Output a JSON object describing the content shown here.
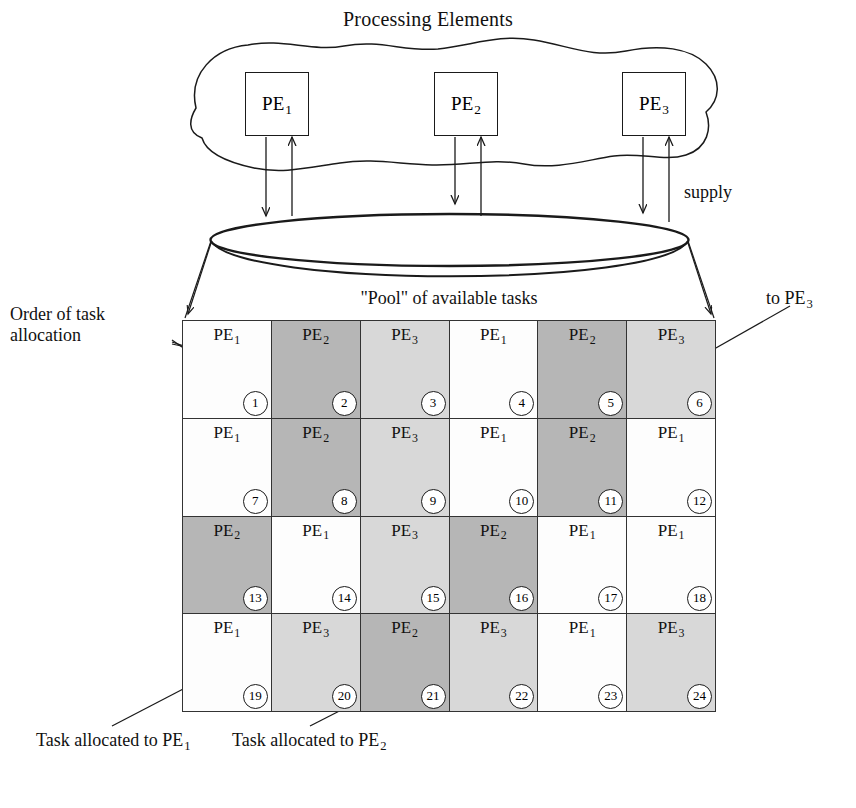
{
  "figure": {
    "title": "Processing Elements",
    "pool_caption": "\"Pool\" of available tasks",
    "supply_label": "supply",
    "to_pe3_label": "to PE",
    "to_pe3_sub": "3",
    "order_label": "Order of task allocation",
    "legend": [
      {
        "text": "Task allocated to PE",
        "sub": "1",
        "swatch": "#fdfdfd"
      },
      {
        "text": "Task allocated to PE",
        "sub": "2",
        "swatch": "#b6b6b6"
      }
    ]
  },
  "processing_elements": [
    {
      "name": "PE",
      "sub": "1"
    },
    {
      "name": "PE",
      "sub": "2"
    },
    {
      "name": "PE",
      "sub": "3"
    }
  ],
  "colors": {
    "pe1": "#fdfdfd",
    "pe2": "#b6b6b6",
    "pe3": "#d8d8d8",
    "stroke": "#1a1a1a",
    "grid_stroke": "#333333",
    "background": "#ffffff"
  },
  "grid": {
    "columns": 6,
    "rows": 4,
    "cells": [
      {
        "index": 1,
        "pe": "PE",
        "sub": "1",
        "cls": "pe1"
      },
      {
        "index": 2,
        "pe": "PE",
        "sub": "2",
        "cls": "pe2"
      },
      {
        "index": 3,
        "pe": "PE",
        "sub": "3",
        "cls": "pe3"
      },
      {
        "index": 4,
        "pe": "PE",
        "sub": "1",
        "cls": "pe1"
      },
      {
        "index": 5,
        "pe": "PE",
        "sub": "2",
        "cls": "pe2"
      },
      {
        "index": 6,
        "pe": "PE",
        "sub": "3",
        "cls": "pe3"
      },
      {
        "index": 7,
        "pe": "PE",
        "sub": "1",
        "cls": "pe1"
      },
      {
        "index": 8,
        "pe": "PE",
        "sub": "2",
        "cls": "pe2"
      },
      {
        "index": 9,
        "pe": "PE",
        "sub": "3",
        "cls": "pe3"
      },
      {
        "index": 10,
        "pe": "PE",
        "sub": "1",
        "cls": "pe1"
      },
      {
        "index": 11,
        "pe": "PE",
        "sub": "2",
        "cls": "pe2"
      },
      {
        "index": 12,
        "pe": "PE",
        "sub": "1",
        "cls": "pe1"
      },
      {
        "index": 13,
        "pe": "PE",
        "sub": "2",
        "cls": "pe2"
      },
      {
        "index": 14,
        "pe": "PE",
        "sub": "1",
        "cls": "pe1"
      },
      {
        "index": 15,
        "pe": "PE",
        "sub": "3",
        "cls": "pe3"
      },
      {
        "index": 16,
        "pe": "PE",
        "sub": "2",
        "cls": "pe2"
      },
      {
        "index": 17,
        "pe": "PE",
        "sub": "1",
        "cls": "pe1"
      },
      {
        "index": 18,
        "pe": "PE",
        "sub": "1",
        "cls": "pe1"
      },
      {
        "index": 19,
        "pe": "PE",
        "sub": "1",
        "cls": "pe1"
      },
      {
        "index": 20,
        "pe": "PE",
        "sub": "3",
        "cls": "pe3"
      },
      {
        "index": 21,
        "pe": "PE",
        "sub": "2",
        "cls": "pe2"
      },
      {
        "index": 22,
        "pe": "PE",
        "sub": "3",
        "cls": "pe3"
      },
      {
        "index": 23,
        "pe": "PE",
        "sub": "1",
        "cls": "pe1"
      },
      {
        "index": 24,
        "pe": "PE",
        "sub": "3",
        "cls": "pe3"
      }
    ]
  }
}
